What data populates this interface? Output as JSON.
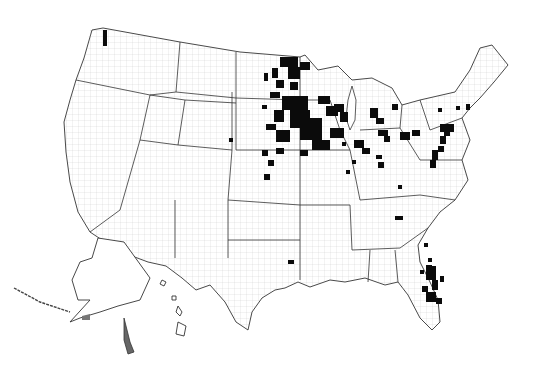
{
  "map": {
    "type": "choropleth",
    "region": "United States counties",
    "legend": null,
    "title": null,
    "colors": {
      "background": "#ffffff",
      "border": "#333333",
      "highlight": "#0b0b0b"
    },
    "highlighted_regions": [
      "Minnesota",
      "Iowa",
      "Wisconsin",
      "Michigan",
      "Illinois",
      "Indiana",
      "Ohio",
      "Pennsylvania",
      "Florida",
      "Nebraska",
      "South Dakota",
      "Washington coast"
    ]
  }
}
